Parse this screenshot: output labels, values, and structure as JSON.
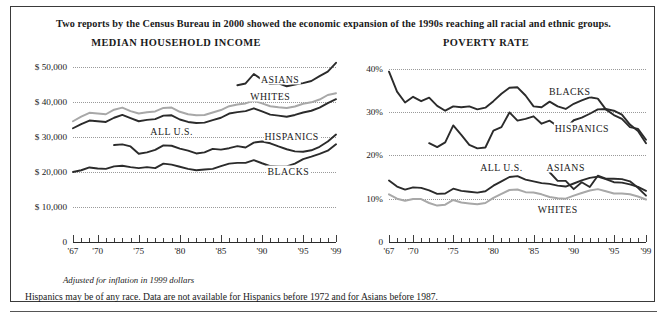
{
  "headline": "Two reports by the Census Bureau in 2000 showed the economic expansion of the 1990s reaching all racial and ethnic groups.",
  "footnote_italic": "Adjusted for inflation in 1999 dollars",
  "footnote": "Hispanics may be of any race. Data are not available for Hispanics before 1972 and for Asians before 1987.",
  "colors": {
    "dark": "#2b2b2b",
    "gray": "#a8a8a8",
    "grid": "#9a9a9a",
    "axis": "#2b2b2b",
    "border": "#3a3a3a",
    "text": "#1a1a1a"
  },
  "chart_data": [
    {
      "type": "line",
      "title": "MEDIAN HOUSEHOLD INCOME",
      "xlabel": "",
      "ylabel": "",
      "xlim": [
        1967,
        1999
      ],
      "ylim": [
        0,
        52000
      ],
      "grid": true,
      "legend": "inline-labels",
      "yticks": [
        {
          "value": 50000,
          "label": "$ 50,000"
        },
        {
          "value": 40000,
          "label": "$ 40,000"
        },
        {
          "value": 30000,
          "label": "$ 30,000"
        },
        {
          "value": 20000,
          "label": "$ 20,000"
        },
        {
          "value": 10000,
          "label": "$ 10,000"
        },
        {
          "value": 0,
          "label": "0"
        }
      ],
      "xticks": [
        {
          "value": 1967,
          "label": "'67"
        },
        {
          "value": 1970,
          "label": "'70"
        },
        {
          "value": 1975,
          "label": "'75"
        },
        {
          "value": 1980,
          "label": "'80"
        },
        {
          "value": 1985,
          "label": "'85"
        },
        {
          "value": 1990,
          "label": "'90"
        },
        {
          "value": 1995,
          "label": "'95"
        },
        {
          "value": 1999,
          "label": "'99"
        }
      ],
      "series": [
        {
          "name": "ASIANS",
          "color": "#2b2b2b",
          "label_x": 1992.2,
          "label_y": 46600,
          "x": [
            1987,
            1988,
            1989,
            1990,
            1991,
            1992,
            1993,
            1994,
            1995,
            1996,
            1997,
            1998,
            1999
          ],
          "values": [
            44800,
            45300,
            48000,
            46400,
            45100,
            45300,
            44500,
            45000,
            45400,
            46000,
            47400,
            48700,
            51200
          ]
        },
        {
          "name": "WHITES",
          "color": "#a8a8a8",
          "label_x": 1991.0,
          "label_y": 41800,
          "x": [
            1967,
            1968,
            1969,
            1970,
            1971,
            1972,
            1973,
            1974,
            1975,
            1976,
            1977,
            1978,
            1979,
            1980,
            1981,
            1982,
            1983,
            1984,
            1985,
            1986,
            1987,
            1988,
            1989,
            1990,
            1991,
            1992,
            1993,
            1994,
            1995,
            1996,
            1997,
            1998,
            1999
          ],
          "values": [
            34500,
            35800,
            36900,
            36700,
            36500,
            37800,
            38400,
            37400,
            36700,
            37100,
            37300,
            38300,
            38400,
            37200,
            36500,
            36200,
            36300,
            37000,
            37700,
            38800,
            39300,
            39600,
            40400,
            39600,
            38800,
            38500,
            38300,
            38700,
            39500,
            39900,
            40700,
            42000,
            42500
          ]
        },
        {
          "name": "ALL U.S.",
          "color": "#2b2b2b",
          "label_x": 1979.0,
          "label_y": 31600,
          "x": [
            1967,
            1968,
            1969,
            1970,
            1971,
            1972,
            1973,
            1974,
            1975,
            1976,
            1977,
            1978,
            1979,
            1980,
            1981,
            1982,
            1983,
            1984,
            1985,
            1986,
            1987,
            1988,
            1989,
            1990,
            1991,
            1992,
            1993,
            1994,
            1995,
            1996,
            1997,
            1998,
            1999
          ],
          "values": [
            32500,
            33700,
            34700,
            34500,
            34300,
            35500,
            36300,
            35400,
            34500,
            34900,
            35100,
            36100,
            36200,
            35000,
            34300,
            34000,
            34100,
            34800,
            35500,
            36700,
            37100,
            37400,
            38200,
            37300,
            36400,
            36100,
            35800,
            36300,
            37000,
            37500,
            38400,
            39700,
            40800
          ]
        },
        {
          "name": "HISPANICS",
          "color": "#2b2b2b",
          "label_x": 1993.6,
          "label_y": 30200,
          "x": [
            1972,
            1973,
            1974,
            1975,
            1976,
            1977,
            1978,
            1979,
            1980,
            1981,
            1982,
            1983,
            1984,
            1985,
            1986,
            1987,
            1988,
            1989,
            1990,
            1991,
            1992,
            1993,
            1994,
            1995,
            1996,
            1997,
            1998,
            1999
          ],
          "values": [
            27700,
            27900,
            27300,
            25200,
            25600,
            26300,
            27600,
            27500,
            26700,
            26100,
            25300,
            25600,
            26600,
            26400,
            26800,
            27400,
            27000,
            28400,
            28700,
            28200,
            27300,
            26500,
            25900,
            25800,
            26200,
            27200,
            28700,
            30700
          ]
        },
        {
          "name": "BLACKS",
          "color": "#2b2b2b",
          "label_x": 1993.2,
          "label_y": 20200,
          "x": [
            1967,
            1968,
            1969,
            1970,
            1971,
            1972,
            1973,
            1974,
            1975,
            1976,
            1977,
            1978,
            1979,
            1980,
            1981,
            1982,
            1983,
            1984,
            1985,
            1986,
            1987,
            1988,
            1989,
            1990,
            1991,
            1992,
            1993,
            1994,
            1995,
            1996,
            1997,
            1998,
            1999
          ],
          "values": [
            20000,
            20500,
            21300,
            21000,
            20900,
            21600,
            21800,
            21400,
            21100,
            21400,
            21100,
            22400,
            22100,
            21500,
            20900,
            20500,
            20700,
            20900,
            21700,
            22400,
            22600,
            22600,
            23400,
            22500,
            21700,
            21600,
            21600,
            22400,
            23700,
            24400,
            25200,
            26100,
            27900
          ]
        }
      ]
    },
    {
      "type": "line",
      "title": "POVERTY RATE",
      "xlabel": "",
      "ylabel": "",
      "xlim": [
        1967,
        1999
      ],
      "ylim": [
        0,
        42
      ],
      "grid": true,
      "legend": "inline-labels",
      "yticks": [
        {
          "value": 40,
          "label": "40%"
        },
        {
          "value": 30,
          "label": "30%"
        },
        {
          "value": 20,
          "label": "20%"
        },
        {
          "value": 10,
          "label": "10%"
        },
        {
          "value": 0,
          "label": "0"
        }
      ],
      "xticks": [
        {
          "value": 1967,
          "label": "'67"
        },
        {
          "value": 1970,
          "label": "'70"
        },
        {
          "value": 1975,
          "label": "'75"
        },
        {
          "value": 1980,
          "label": "'80"
        },
        {
          "value": 1985,
          "label": "'85"
        },
        {
          "value": 1990,
          "label": "'90"
        },
        {
          "value": 1995,
          "label": "'95"
        },
        {
          "value": 1999,
          "label": "'99"
        }
      ],
      "series": [
        {
          "name": "BLACKS",
          "color": "#2b2b2b",
          "label_x": 1989.5,
          "label_y": 34.8,
          "x": [
            1967,
            1968,
            1969,
            1970,
            1971,
            1972,
            1973,
            1974,
            1975,
            1976,
            1977,
            1978,
            1979,
            1980,
            1981,
            1982,
            1983,
            1984,
            1985,
            1986,
            1987,
            1988,
            1989,
            1990,
            1991,
            1992,
            1993,
            1994,
            1995,
            1996,
            1997,
            1998,
            1999
          ],
          "values": [
            39.3,
            34.7,
            32.2,
            33.5,
            32.5,
            33.3,
            31.4,
            30.3,
            31.3,
            31.1,
            31.3,
            30.6,
            31.0,
            32.5,
            34.2,
            35.6,
            35.7,
            33.8,
            31.3,
            31.1,
            32.4,
            31.3,
            30.7,
            31.9,
            32.7,
            33.4,
            33.1,
            30.6,
            29.3,
            28.4,
            26.5,
            26.1,
            23.6
          ]
        },
        {
          "name": "HISPANICS",
          "color": "#2b2b2b",
          "label_x": 1991.0,
          "label_y": 26.2,
          "x": [
            1972,
            1973,
            1974,
            1975,
            1976,
            1977,
            1978,
            1979,
            1980,
            1981,
            1982,
            1983,
            1984,
            1985,
            1986,
            1987,
            1988,
            1989,
            1990,
            1991,
            1992,
            1993,
            1994,
            1995,
            1996,
            1997,
            1998,
            1999
          ],
          "values": [
            22.8,
            21.9,
            23.0,
            26.9,
            24.7,
            22.4,
            21.6,
            21.8,
            25.7,
            26.5,
            29.9,
            28.0,
            28.4,
            29.0,
            27.3,
            28.0,
            26.7,
            26.2,
            28.1,
            28.7,
            29.6,
            30.6,
            30.7,
            30.3,
            29.4,
            27.1,
            25.6,
            22.8
          ]
        },
        {
          "name": "ALL U.S.",
          "color": "#2b2b2b",
          "label_x": 1981.0,
          "label_y": 17.2,
          "x": [
            1967,
            1968,
            1969,
            1970,
            1971,
            1972,
            1973,
            1974,
            1975,
            1976,
            1977,
            1978,
            1979,
            1980,
            1981,
            1982,
            1983,
            1984,
            1985,
            1986,
            1987,
            1988,
            1989,
            1990,
            1991,
            1992,
            1993,
            1994,
            1995,
            1996,
            1997,
            1998,
            1999
          ],
          "values": [
            14.2,
            12.8,
            12.1,
            12.6,
            12.5,
            11.9,
            11.1,
            11.2,
            12.3,
            11.8,
            11.6,
            11.4,
            11.7,
            13.0,
            14.0,
            15.0,
            15.2,
            14.4,
            14.0,
            13.6,
            13.4,
            13.0,
            12.8,
            13.5,
            14.2,
            14.8,
            15.1,
            14.5,
            13.8,
            13.7,
            13.3,
            12.7,
            11.8
          ]
        },
        {
          "name": "ASIANS",
          "color": "#2b2b2b",
          "label_x": 1989.0,
          "label_y": 17.4,
          "x": [
            1987,
            1988,
            1989,
            1990,
            1991,
            1992,
            1993,
            1994,
            1995,
            1996,
            1997,
            1998,
            1999
          ],
          "values": [
            16.1,
            14.1,
            14.1,
            12.2,
            13.8,
            12.7,
            15.3,
            14.6,
            14.6,
            14.5,
            14.0,
            12.5,
            10.7
          ]
        },
        {
          "name": "WHITES",
          "color": "#a8a8a8",
          "label_x": 1988.0,
          "label_y": 7.6,
          "x": [
            1967,
            1968,
            1969,
            1970,
            1971,
            1972,
            1973,
            1974,
            1975,
            1976,
            1977,
            1978,
            1979,
            1980,
            1981,
            1982,
            1983,
            1984,
            1985,
            1986,
            1987,
            1988,
            1989,
            1990,
            1991,
            1992,
            1993,
            1994,
            1995,
            1996,
            1997,
            1998,
            1999
          ],
          "values": [
            11.0,
            10.0,
            9.5,
            9.9,
            9.9,
            9.0,
            8.4,
            8.6,
            9.7,
            9.1,
            8.9,
            8.7,
            9.0,
            10.2,
            11.1,
            12.0,
            12.1,
            11.5,
            11.4,
            11.0,
            10.4,
            10.1,
            10.0,
            10.7,
            11.3,
            11.9,
            12.2,
            11.7,
            11.2,
            11.2,
            11.0,
            10.5,
            9.8
          ]
        }
      ]
    }
  ]
}
